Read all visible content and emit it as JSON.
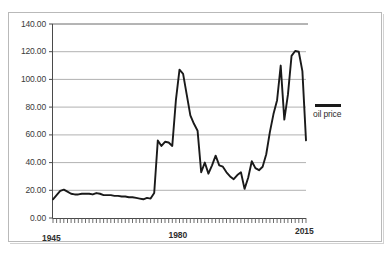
{
  "chart_data": {
    "type": "line",
    "title": "",
    "subtitle": "",
    "xlabel": "",
    "ylabel": "",
    "grid": true,
    "legend_position": "right",
    "xlim": [
      1945,
      2015
    ],
    "ylim": [
      0,
      140
    ],
    "y_ticks": [
      "0.00",
      "20.00",
      "40.00",
      "60.00",
      "80.00",
      "100.00",
      "120.00",
      "140.00"
    ],
    "y_tick_values": [
      0,
      20,
      40,
      60,
      80,
      100,
      120,
      140
    ],
    "x_ticks": [
      "1945",
      "1980",
      "2015"
    ],
    "x_tick_values": [
      1945,
      1980,
      2015
    ],
    "x_minor_tick_interval": 1,
    "series": [
      {
        "name": "oil price",
        "color": "#1a1a1a",
        "x": [
          1945,
          1946,
          1947,
          1948,
          1949,
          1950,
          1951,
          1952,
          1953,
          1954,
          1955,
          1956,
          1957,
          1958,
          1959,
          1960,
          1961,
          1962,
          1963,
          1964,
          1965,
          1966,
          1967,
          1968,
          1969,
          1970,
          1971,
          1972,
          1973,
          1974,
          1975,
          1976,
          1977,
          1978,
          1979,
          1980,
          1981,
          1982,
          1983,
          1984,
          1985,
          1986,
          1987,
          1988,
          1989,
          1990,
          1991,
          1992,
          1993,
          1994,
          1995,
          1996,
          1997,
          1998,
          1999,
          2000,
          2001,
          2002,
          2003,
          2004,
          2005,
          2006,
          2007,
          2008,
          2009,
          2010,
          2011,
          2012,
          2013,
          2014,
          2015
        ],
        "values": [
          13.5,
          16.5,
          19.5,
          20.5,
          19.0,
          17.5,
          17.0,
          17.0,
          17.5,
          17.5,
          17.5,
          17.0,
          18.0,
          17.5,
          16.5,
          16.5,
          16.5,
          16.0,
          16.0,
          15.5,
          15.5,
          15.0,
          15.0,
          14.5,
          14.0,
          13.5,
          14.5,
          14.0,
          18.0,
          56.0,
          52.0,
          55.0,
          54.5,
          52.0,
          85.0,
          107.0,
          104.0,
          89.0,
          74.0,
          68.0,
          63.0,
          33.0,
          40.0,
          32.0,
          38.0,
          45.0,
          38.0,
          37.0,
          33.0,
          30.0,
          28.0,
          31.0,
          33.0,
          21.0,
          29.0,
          41.0,
          36.0,
          34.5,
          37.0,
          46.0,
          62.0,
          75.0,
          85.0,
          110.0,
          71.0,
          89.0,
          117.0,
          120.5,
          120.0,
          106.0,
          56.0
        ]
      }
    ]
  },
  "legend": {
    "label": "oil price"
  },
  "axes": {
    "y_labels": [
      "140.00",
      "120.00",
      "100.00",
      "80.00",
      "60.00",
      "40.00",
      "20.00",
      "0.00"
    ],
    "x_labels": [
      "1945",
      "1980",
      "2015"
    ]
  }
}
